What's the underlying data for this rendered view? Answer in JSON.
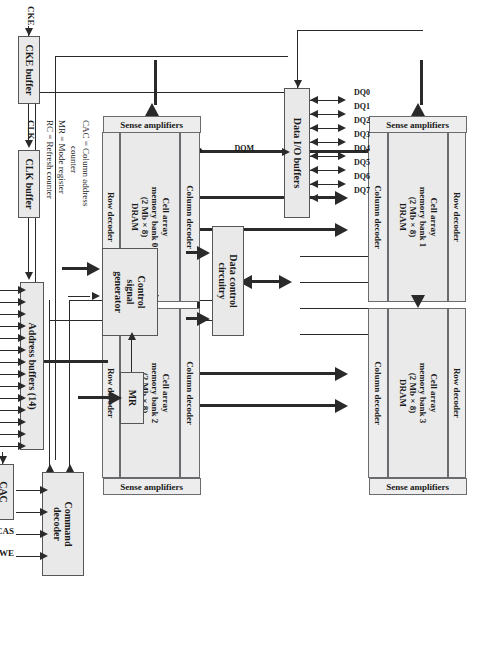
{
  "figure": {
    "type": "block-diagram",
    "orientation": "rotated-90-clockwise"
  },
  "blocks": {
    "data_io_buffers": "Data I/O buffers",
    "data_control": "Data control\ncircuitry",
    "control_signal_generator": "Control\nsignal\ngenerator",
    "mode_register": "MR",
    "command_decoder": "Command\ndecoder",
    "address_buffers": "Address buffers (14)",
    "column_address_counter": "CAC",
    "refresh_counter": "RC",
    "cke_buffer": "CKE buffer",
    "clk_buffer": "CLK buffer"
  },
  "banks": [
    {
      "id": "bank0",
      "column_decoder": "Column decoder",
      "cell_array": "Cell array\nmemory bank 0\n(2 Mb × 8)\nDRAM",
      "sense_amplifiers": "Sense amplifiers",
      "row_decoder": "Row decoder"
    },
    {
      "id": "bank1",
      "column_decoder": "Column decoder",
      "cell_array": "Cell array\nmemory bank 1\n(2 Mb × 8)\nDRAM",
      "sense_amplifiers": "Sense amplifiers",
      "row_decoder": "Row decoder"
    },
    {
      "id": "bank2",
      "column_decoder": "Column decoder",
      "cell_array": "Cell array\nmemory bank 2\n(2 Mb × 8)\nDRAM",
      "sense_amplifiers": "Sense amplifiers",
      "row_decoder": "Row decoder"
    },
    {
      "id": "bank3",
      "column_decoder": "Column decoder",
      "cell_array": "Cell array\nmemory bank 3\n(2 Mb × 8)\nDRAM",
      "sense_amplifiers": "Sense amplifiers",
      "row_decoder": "Row decoder"
    }
  ],
  "data_pins": [
    "DQ0",
    "DQ1",
    "DQ2",
    "DQ3",
    "DQ4",
    "DQ5",
    "DQ6",
    "DQ7"
  ],
  "mask_pin": "DQM",
  "address_pins": [
    "A0",
    "A1",
    "A2",
    "A3",
    "A4",
    "A5",
    "A6",
    "A7",
    "A8",
    "A9",
    "A11",
    "A12",
    "A13",
    "A10"
  ],
  "clock_pins": [
    "CKE",
    "CLK"
  ],
  "command_pins": [
    {
      "label": "CS",
      "active_low": true
    },
    {
      "label": "RAS",
      "active_low": true
    },
    {
      "label": "CAS",
      "active_low": true
    },
    {
      "label": "WE",
      "active_low": true
    }
  ],
  "legend": [
    {
      "abbr": "CAC",
      "eq": "=",
      "meaning": "Column address"
    },
    {
      "abbr": "",
      "eq": "",
      "meaning": "counter"
    },
    {
      "abbr": "MR",
      "eq": "=",
      "meaning": "Mode register"
    },
    {
      "abbr": "RC",
      "eq": "=",
      "meaning": "Refresh counter"
    }
  ],
  "colors": {
    "block_fill": "#e9e9e9",
    "block_border": "#55565a",
    "wire": "#2a2a2a",
    "page_background": "#ffffff"
  }
}
